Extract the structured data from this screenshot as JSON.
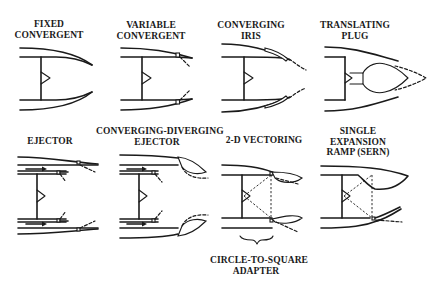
{
  "figure": {
    "stroke_color": "#1a1a1a",
    "background_color": "#ffffff"
  },
  "nozzles": [
    {
      "id": "fixed-convergent",
      "label_line1": "FIXED",
      "label_line2": "CONVERGENT"
    },
    {
      "id": "variable-convergent",
      "label_line1": "VARIABLE",
      "label_line2": "CONVERGENT"
    },
    {
      "id": "converging-iris",
      "label_line1": "CONVERGING",
      "label_line2": "IRIS"
    },
    {
      "id": "translating-plug",
      "label_line1": "TRANSLATING",
      "label_line2": "PLUG"
    },
    {
      "id": "ejector",
      "label_line1": "EJECTOR"
    },
    {
      "id": "converging-diverging-ejector",
      "label_line1": "CONVERGING-DIVERGING",
      "label_line2": "EJECTOR"
    },
    {
      "id": "2d-vectoring",
      "label_line1": "2-D VECTORING"
    },
    {
      "id": "serne",
      "label_line1": "SINGLE",
      "label_line2": "EXPANSION",
      "label_line3": "RAMP (SERN)"
    }
  ],
  "annotations": {
    "adapter_line1": "CIRCLE-TO-SQUARE",
    "adapter_line2": "ADAPTER"
  }
}
